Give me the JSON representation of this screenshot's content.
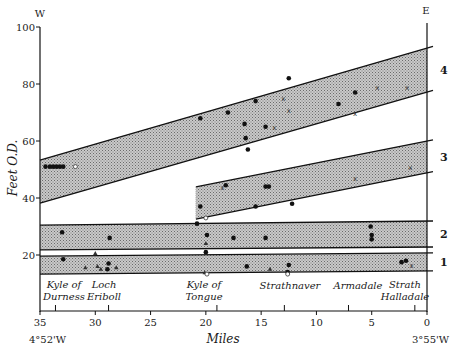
{
  "chart_data": {
    "type": "scatter",
    "title": "",
    "xlabel": "Miles",
    "ylabel": "Feet O.D.",
    "xlim": [
      35,
      0
    ],
    "ylim": [
      0,
      100
    ],
    "x_ticks": [
      35,
      30,
      25,
      20,
      15,
      10,
      5,
      0
    ],
    "y_ticks": [
      20,
      40,
      60,
      80,
      100
    ],
    "grid": false,
    "direction_labels": {
      "west": "W",
      "east": "E"
    },
    "longitude_labels": {
      "left": "4°52'W",
      "right": "3°55'W"
    },
    "locations": [
      {
        "name_line1": "Kyle of",
        "name_line2": "Durness",
        "mile": 33.6
      },
      {
        "name_line1": "Loch",
        "name_line2": "Eriboll",
        "mile": 28.8
      },
      {
        "name_line1": "Kyle of",
        "name_line2": "Tongue",
        "mile": 19
      },
      {
        "name_line1": "",
        "name_line2": "Strathnaver",
        "mile": 12.9
      },
      {
        "name_line1": "",
        "name_line2": "Armadale",
        "mile": 7.1
      },
      {
        "name_line1": "Strath",
        "name_line2": "Halladale",
        "mile": 1.1
      }
    ],
    "bands": [
      {
        "label": "1",
        "from_mile": 35,
        "to_mile": 0,
        "top": [
          19.6,
          20.7
        ],
        "bottom": [
          13.3,
          14.4
        ]
      },
      {
        "label": "2",
        "from_mile": 35,
        "to_mile": 0,
        "top": [
          30.5,
          31.9
        ],
        "bottom": [
          21.8,
          22.8
        ]
      },
      {
        "label": "3",
        "from_mile": 20.9,
        "to_mile": 0,
        "top": [
          43.9,
          60.0
        ],
        "bottom": [
          32.6,
          48.8
        ]
      },
      {
        "label": "4",
        "from_mile": 35,
        "to_mile": 0,
        "top": [
          53.3,
          92.6
        ],
        "bottom": [
          38.2,
          77.2
        ]
      }
    ],
    "series": [
      {
        "name": "dot",
        "points": [
          [
            34.5,
            51
          ],
          [
            34.1,
            51
          ],
          [
            33.8,
            51
          ],
          [
            33.5,
            51
          ],
          [
            33.2,
            51
          ],
          [
            32.9,
            51
          ],
          [
            33.0,
            28
          ],
          [
            28.7,
            26
          ],
          [
            32.9,
            18.5
          ],
          [
            28.8,
            17
          ],
          [
            28.9,
            15
          ],
          [
            20.8,
            31
          ],
          [
            20.5,
            37
          ],
          [
            20.0,
            21
          ],
          [
            19.9,
            27
          ],
          [
            18.2,
            44.5
          ],
          [
            17.5,
            26
          ],
          [
            16.3,
            16
          ],
          [
            14.6,
            44
          ],
          [
            14.3,
            44
          ],
          [
            14.6,
            26
          ],
          [
            15.5,
            37
          ],
          [
            12.6,
            14
          ],
          [
            12.5,
            16.5
          ],
          [
            12.2,
            38
          ],
          [
            20.5,
            68
          ],
          [
            18.0,
            70
          ],
          [
            16.5,
            66
          ],
          [
            16.4,
            61
          ],
          [
            16.2,
            57
          ],
          [
            15.5,
            74
          ],
          [
            12.5,
            82
          ],
          [
            14.6,
            65
          ],
          [
            8.0,
            73
          ],
          [
            6.5,
            77
          ],
          [
            5.1,
            30
          ],
          [
            5.0,
            25.5
          ],
          [
            5.0,
            27
          ],
          [
            2.3,
            17.5
          ],
          [
            1.9,
            18
          ]
        ]
      },
      {
        "name": "cross",
        "points": [
          [
            13.0,
            75
          ],
          [
            13.8,
            65
          ],
          [
            12.5,
            71
          ],
          [
            6.5,
            70
          ],
          [
            6.5,
            47
          ],
          [
            1.8,
            79
          ],
          [
            4.5,
            79
          ],
          [
            1.5,
            51
          ],
          [
            1.4,
            16.5
          ],
          [
            18.5,
            44
          ]
        ]
      },
      {
        "name": "triangle",
        "points": [
          [
            30.0,
            20.5
          ],
          [
            30.9,
            15.5
          ],
          [
            29.8,
            16
          ],
          [
            29.5,
            15
          ],
          [
            28.1,
            15.5
          ],
          [
            20.0,
            24
          ],
          [
            20.1,
            13.8
          ],
          [
            14.2,
            15
          ]
        ]
      },
      {
        "name": "open-circle",
        "points": [
          [
            31.8,
            51
          ],
          [
            20.0,
            33
          ],
          [
            19.9,
            13.3
          ],
          [
            12.6,
            13.3
          ]
        ]
      }
    ]
  }
}
